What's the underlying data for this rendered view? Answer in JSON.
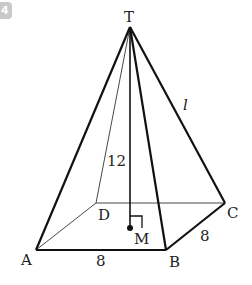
{
  "problem_number": "4",
  "figure": {
    "type": "square pyramid",
    "vertices": {
      "apex": "T",
      "base": [
        "A",
        "B",
        "C",
        "D"
      ],
      "foot_of_height": "M"
    },
    "labels": {
      "T": "T",
      "A": "A",
      "B": "B",
      "C": "C",
      "D": "D",
      "M": "M",
      "height": "12",
      "base_ab": "8",
      "base_bc": "8",
      "lateral_edge": "l"
    },
    "colors": {
      "line": "#111111",
      "badge": "#c9c9c9"
    }
  }
}
